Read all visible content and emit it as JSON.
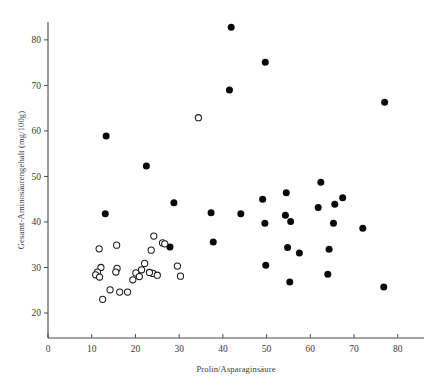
{
  "chart": {
    "title": "",
    "xlabel": "Prolin/Asparaginsäure",
    "ylabel": "Gesamt-Aminosäurengehalt (mg/100g)",
    "zero_label": "0",
    "marker_filled_name": "filled-circle-marker",
    "marker_open_name": "open-circle-marker",
    "colors": {
      "filled": "#090909",
      "open_stroke": "#1a1a1a",
      "open_fill": "#ffffff",
      "axis": "#4a4a4a",
      "text": "#3a3a3a",
      "background": "#ffffff"
    }
  },
  "chart_data": {
    "type": "scatter",
    "title": "",
    "xlabel": "Prolin/Asparaginsäure",
    "ylabel": "Gesamt-Aminosäurengehalt (mg/100g)",
    "xlim": [
      0,
      85
    ],
    "ylim": [
      17,
      85
    ],
    "xticks": [
      0,
      10,
      20,
      30,
      40,
      50,
      60,
      70,
      80
    ],
    "xticklabels": [
      "0",
      "10",
      "20",
      "30",
      "40",
      "50",
      "60",
      "70",
      "80"
    ],
    "yticks": [
      20,
      30,
      40,
      50,
      60,
      70,
      80
    ],
    "yticklabels": [
      "20",
      "30",
      "40",
      "50",
      "60",
      "70",
      "80"
    ],
    "grid": false,
    "legend": null,
    "series": [
      {
        "name": "filled",
        "marker": "filled-circle",
        "color": "#090909",
        "points": [
          [
            41.9,
            82.8
          ],
          [
            49.7,
            75.1
          ],
          [
            41.5,
            69.0
          ],
          [
            77.0,
            66.3
          ],
          [
            13.3,
            58.9
          ],
          [
            22.5,
            52.3
          ],
          [
            62.4,
            48.7
          ],
          [
            54.5,
            46.4
          ],
          [
            49.1,
            45.0
          ],
          [
            67.4,
            45.3
          ],
          [
            28.8,
            44.2
          ],
          [
            65.6,
            43.9
          ],
          [
            61.8,
            43.2
          ],
          [
            44.1,
            41.8
          ],
          [
            13.1,
            41.8
          ],
          [
            37.3,
            42.0
          ],
          [
            54.3,
            41.5
          ],
          [
            65.3,
            39.7
          ],
          [
            49.6,
            39.7
          ],
          [
            55.5,
            40.1
          ],
          [
            72.0,
            38.6
          ],
          [
            37.8,
            35.6
          ],
          [
            27.9,
            34.5
          ],
          [
            54.8,
            34.4
          ],
          [
            64.3,
            34.0
          ],
          [
            57.5,
            33.2
          ],
          [
            49.8,
            30.5
          ],
          [
            64.0,
            28.5
          ],
          [
            55.3,
            26.8
          ],
          [
            76.8,
            25.7
          ]
        ]
      },
      {
        "name": "open",
        "marker": "open-circle",
        "color": "#1a1a1a",
        "points": [
          [
            34.4,
            62.9
          ],
          [
            24.2,
            36.9
          ],
          [
            26.2,
            35.4
          ],
          [
            26.7,
            35.2
          ],
          [
            15.7,
            34.9
          ],
          [
            11.7,
            34.1
          ],
          [
            23.6,
            33.8
          ],
          [
            22.1,
            30.9
          ],
          [
            29.6,
            30.3
          ],
          [
            12.1,
            30.0
          ],
          [
            15.8,
            29.8
          ],
          [
            11.3,
            29.0
          ],
          [
            15.5,
            29.0
          ],
          [
            20.1,
            28.8
          ],
          [
            24.0,
            28.7
          ],
          [
            30.3,
            28.1
          ],
          [
            10.9,
            28.4
          ],
          [
            11.8,
            27.9
          ],
          [
            20.9,
            28.0
          ],
          [
            19.4,
            27.3
          ],
          [
            21.4,
            29.5
          ],
          [
            25.0,
            28.3
          ],
          [
            23.2,
            28.9
          ],
          [
            14.2,
            25.1
          ],
          [
            16.4,
            24.6
          ],
          [
            18.2,
            24.6
          ],
          [
            12.5,
            23.0
          ]
        ]
      }
    ]
  }
}
